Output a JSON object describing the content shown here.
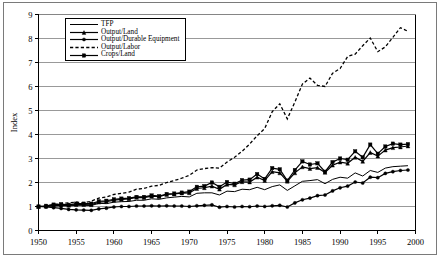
{
  "chart_data": {
    "type": "line",
    "title": "",
    "xlabel": "",
    "ylabel": "Index",
    "xlim": [
      1950,
      2000
    ],
    "ylim": [
      0,
      9
    ],
    "xticks": [
      1950,
      1955,
      1960,
      1965,
      1970,
      1975,
      1980,
      1985,
      1990,
      1995,
      2000
    ],
    "yticks": [
      0,
      1,
      2,
      3,
      4,
      5,
      6,
      7,
      8,
      9
    ],
    "grid": "horizontal",
    "legend_position": "top-left-inside",
    "x": [
      1950,
      1951,
      1952,
      1953,
      1954,
      1955,
      1956,
      1957,
      1958,
      1959,
      1960,
      1961,
      1962,
      1963,
      1964,
      1965,
      1966,
      1967,
      1968,
      1969,
      1970,
      1971,
      1972,
      1973,
      1974,
      1975,
      1976,
      1977,
      1978,
      1979,
      1980,
      1981,
      1982,
      1983,
      1984,
      1985,
      1986,
      1987,
      1988,
      1989,
      1990,
      1991,
      1992,
      1993,
      1994,
      1995,
      1996,
      1997,
      1998,
      1999
    ],
    "series": [
      {
        "name": "TFP",
        "marker": "none",
        "style": "solid",
        "values": [
          1.0,
          1.0,
          1.02,
          1.03,
          1.02,
          1.05,
          1.05,
          1.04,
          1.13,
          1.12,
          1.18,
          1.2,
          1.21,
          1.26,
          1.26,
          1.32,
          1.3,
          1.36,
          1.39,
          1.42,
          1.4,
          1.55,
          1.57,
          1.57,
          1.48,
          1.64,
          1.62,
          1.72,
          1.7,
          1.8,
          1.7,
          1.83,
          1.9,
          1.67,
          1.86,
          2.05,
          2.08,
          2.12,
          1.95,
          2.13,
          2.22,
          2.18,
          2.4,
          2.27,
          2.5,
          2.42,
          2.6,
          2.66,
          2.68,
          2.7
        ]
      },
      {
        "name": "Output/Land",
        "marker": "triangle",
        "style": "solid",
        "values": [
          1.0,
          1.01,
          1.05,
          1.06,
          1.05,
          1.08,
          1.08,
          1.07,
          1.18,
          1.2,
          1.26,
          1.3,
          1.32,
          1.38,
          1.37,
          1.43,
          1.41,
          1.5,
          1.52,
          1.56,
          1.57,
          1.75,
          1.78,
          1.85,
          1.72,
          1.92,
          1.9,
          2.03,
          2.02,
          2.22,
          2.08,
          2.45,
          2.4,
          2.05,
          2.4,
          2.65,
          2.58,
          2.62,
          2.42,
          2.72,
          2.85,
          2.8,
          3.05,
          2.88,
          3.25,
          3.1,
          3.35,
          3.45,
          3.48,
          3.52
        ]
      },
      {
        "name": "Output/Durable Equipment",
        "marker": "circle",
        "style": "solid",
        "values": [
          1.0,
          0.98,
          0.95,
          0.92,
          0.88,
          0.86,
          0.85,
          0.84,
          0.9,
          0.93,
          0.98,
          1.0,
          1.0,
          1.02,
          1.02,
          1.03,
          1.02,
          1.03,
          1.02,
          1.02,
          1.0,
          1.03,
          1.05,
          1.07,
          0.97,
          1.0,
          0.98,
          1.0,
          0.99,
          1.02,
          1.0,
          1.03,
          1.05,
          0.98,
          1.15,
          1.28,
          1.35,
          1.45,
          1.48,
          1.65,
          1.78,
          1.85,
          2.02,
          1.98,
          2.22,
          2.2,
          2.38,
          2.45,
          2.5,
          2.52
        ]
      },
      {
        "name": "Output/Labor",
        "marker": "none",
        "style": "dashed",
        "values": [
          1.0,
          1.02,
          1.08,
          1.12,
          1.15,
          1.18,
          1.15,
          1.22,
          1.35,
          1.4,
          1.5,
          1.55,
          1.6,
          1.72,
          1.75,
          1.85,
          1.88,
          2.0,
          2.08,
          2.18,
          2.3,
          2.52,
          2.58,
          2.62,
          2.6,
          2.85,
          3.05,
          3.3,
          3.6,
          3.95,
          4.25,
          4.95,
          5.28,
          4.65,
          5.35,
          6.1,
          6.35,
          6.05,
          6.0,
          6.55,
          6.75,
          7.25,
          7.35,
          7.7,
          8.02,
          7.45,
          7.65,
          8.05,
          8.45,
          8.3
        ]
      },
      {
        "name": "Crops/Land",
        "marker": "square",
        "style": "solid",
        "values": [
          1.0,
          1.03,
          1.08,
          1.1,
          1.07,
          1.12,
          1.12,
          1.12,
          1.22,
          1.24,
          1.3,
          1.33,
          1.35,
          1.4,
          1.4,
          1.46,
          1.43,
          1.52,
          1.54,
          1.58,
          1.62,
          1.82,
          1.85,
          2.0,
          1.82,
          2.02,
          1.95,
          2.1,
          2.12,
          2.35,
          2.15,
          2.6,
          2.55,
          2.08,
          2.52,
          2.88,
          2.75,
          2.8,
          2.45,
          2.85,
          3.0,
          2.95,
          3.3,
          3.05,
          3.58,
          3.2,
          3.5,
          3.62,
          3.58,
          3.6
        ]
      }
    ]
  },
  "legend": {
    "items": [
      {
        "label": "TFP",
        "marker": "none",
        "style": "solid"
      },
      {
        "label": "Output/Land",
        "marker": "triangle",
        "style": "solid"
      },
      {
        "label": "Output/Durable Equipment",
        "marker": "circle",
        "style": "solid"
      },
      {
        "label": "Output/Labor",
        "marker": "none",
        "style": "dashed"
      },
      {
        "label": "Crops/Land",
        "marker": "square",
        "style": "solid"
      }
    ]
  },
  "colors": {
    "line": "#000000",
    "grid": "#808080",
    "frame": "#7a7a7a",
    "background": "#ffffff"
  }
}
